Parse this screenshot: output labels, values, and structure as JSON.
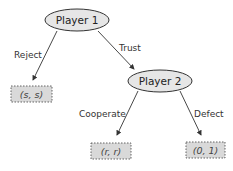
{
  "nodes": {
    "player1": {
      "label": "Player 1"
    },
    "player2": {
      "label": "Player 2"
    }
  },
  "edges": {
    "reject": {
      "label": "Reject"
    },
    "trust": {
      "label": "Trust"
    },
    "cooperate": {
      "label": "Cooperate"
    },
    "defect": {
      "label": "Defect"
    }
  },
  "payoffs": {
    "reject": {
      "label": "(s, s)"
    },
    "cooperate": {
      "label": "(r, r)"
    },
    "defect": {
      "label": "(0, 1)"
    }
  },
  "colors": {
    "node_fill": "#e6e6e6",
    "node_stroke": "#333333",
    "payoff_fill": "#d9d9d9",
    "payoff_stroke": "#555555",
    "edge": "#333333"
  }
}
